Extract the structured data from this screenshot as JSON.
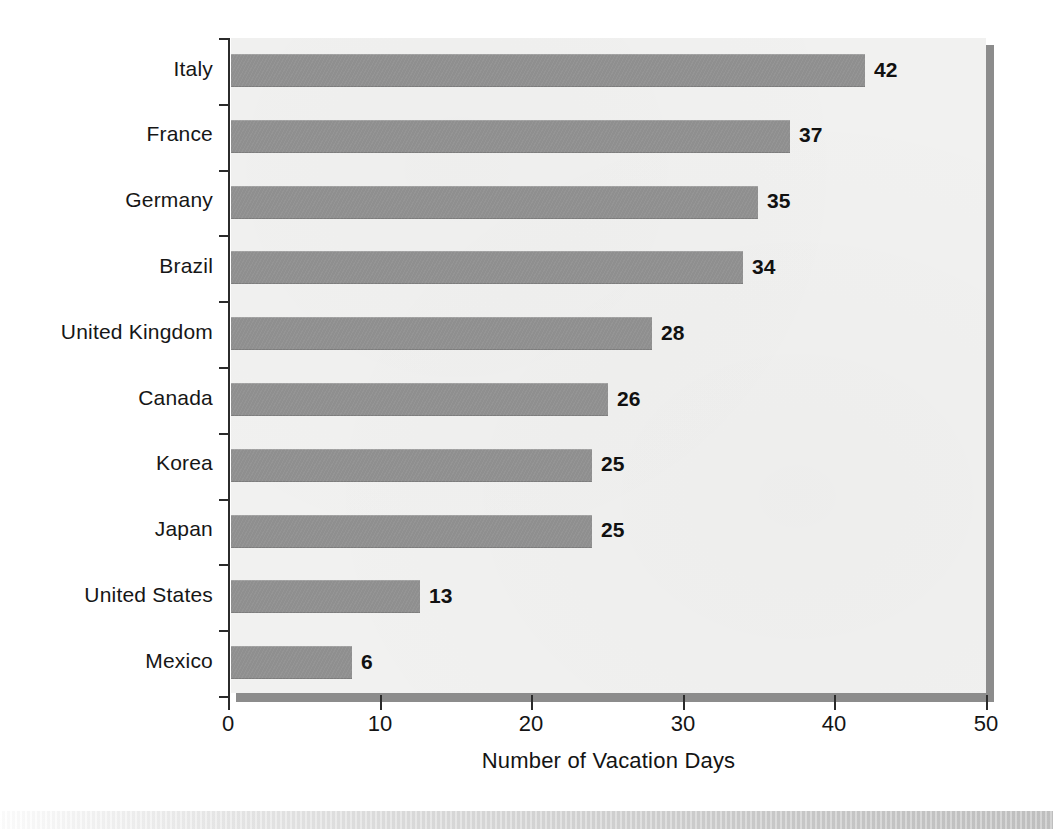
{
  "chart_data": {
    "type": "bar",
    "orientation": "horizontal",
    "title": "",
    "subtitle": "",
    "xlabel": "Number of Vacation Days",
    "ylabel": "",
    "xlim": [
      0,
      50
    ],
    "xticks": [
      0,
      10,
      20,
      30,
      40,
      50
    ],
    "xtick_labels": [
      "0",
      "10",
      "20",
      "30",
      "40",
      "50"
    ],
    "grid": false,
    "legend": null,
    "bar_color": "#8f8f8f",
    "panel_color": "#f1f1f0",
    "axis_color": "#2b2b2b",
    "shadow_color": "#8c8c8c",
    "categories": [
      "Italy",
      "France",
      "Germany",
      "Brazil",
      "United Kingdom",
      "Canada",
      "Korea",
      "Japan",
      "United States",
      "Mexico"
    ],
    "values": [
      42,
      37,
      35,
      34,
      28,
      26,
      25,
      25,
      13,
      6
    ],
    "value_labels": [
      "42",
      "37",
      "35",
      "34",
      "28",
      "26",
      "25",
      "25",
      "13",
      "6"
    ],
    "bars": [
      {
        "category": "Italy",
        "value": 42,
        "label": "42",
        "bar_px_end": 865
      },
      {
        "category": "France",
        "value": 37,
        "label": "37",
        "bar_px_end": 790
      },
      {
        "category": "Germany",
        "value": 35,
        "label": "35",
        "bar_px_end": 758
      },
      {
        "category": "Brazil",
        "value": 34,
        "label": "34",
        "bar_px_end": 743
      },
      {
        "category": "United Kingdom",
        "value": 28,
        "label": "28",
        "bar_px_end": 652
      },
      {
        "category": "Canada",
        "value": 26,
        "label": "26",
        "bar_px_end": 608
      },
      {
        "category": "Korea",
        "value": 25,
        "label": "25",
        "bar_px_end": 592
      },
      {
        "category": "Japan",
        "value": 25,
        "label": "25",
        "bar_px_end": 592
      },
      {
        "category": "United States",
        "value": 13,
        "label": "13",
        "bar_px_end": 420
      },
      {
        "category": "Mexico",
        "value": 6,
        "label": "6",
        "bar_px_end": 352
      }
    ]
  }
}
